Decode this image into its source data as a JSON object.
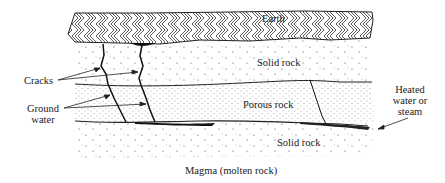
{
  "diagram": {
    "layers": [
      {
        "id": "earth",
        "label": "Earth",
        "pattern": "hatched"
      },
      {
        "id": "solid-rock-upper",
        "label": "Solid rock",
        "pattern": "sparse-dots"
      },
      {
        "id": "porous-rock",
        "label": "Porous rock",
        "pattern": "dense-dots"
      },
      {
        "id": "solid-rock-lower",
        "label": "Solid rock",
        "pattern": "sparse-dots"
      }
    ],
    "callouts": {
      "cracks": "Cracks",
      "ground_water_line1": "Ground",
      "ground_water_line2": "water",
      "heated_line1": "Heated",
      "heated_line2": "water or",
      "heated_line3": "steam"
    },
    "bottom_label": "Magma (molten rock)",
    "colors": {
      "ink": "#222222",
      "background": "#ffffff"
    }
  }
}
